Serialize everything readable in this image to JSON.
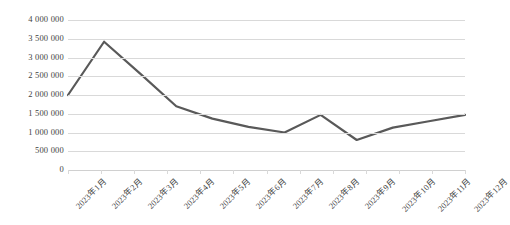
{
  "chart_data": {
    "type": "line",
    "title": "",
    "xlabel": "",
    "ylabel": "",
    "categories": [
      "2023年1月",
      "2023年2月",
      "2023年3月",
      "2023年4月",
      "2023年5月",
      "2023年6月",
      "2023年7月",
      "2023年8月",
      "2023年9月",
      "2023年10月",
      "2023年11月",
      "2023年12月"
    ],
    "values": [
      2000000,
      3420000,
      2570000,
      1700000,
      1370000,
      1150000,
      1000000,
      1470000,
      800000,
      1130000,
      1300000,
      1470000
    ],
    "ylim": [
      0,
      4000000
    ],
    "ytick_values": [
      4000000,
      3500000,
      3000000,
      2500000,
      2000000,
      1500000,
      1000000,
      500000,
      0
    ],
    "ytick_labels": [
      "4 000 000",
      "3 500 000",
      "3 000 000",
      "2 500 000",
      "2 000 000",
      "1 500 000",
      "1 000 000",
      "500 000",
      "0"
    ],
    "grid": true,
    "legend": false,
    "legend_position": "none",
    "series": [
      {
        "name": "",
        "color": "#595959",
        "values": [
          2000000,
          3420000,
          2570000,
          1700000,
          1370000,
          1150000,
          1000000,
          1470000,
          800000,
          1130000,
          1300000,
          1470000
        ]
      }
    ]
  },
  "style": {
    "line_color": "#595959",
    "grid_color": "#d9d9d9",
    "text_color": "#3f3f3f",
    "background": "#ffffff"
  }
}
